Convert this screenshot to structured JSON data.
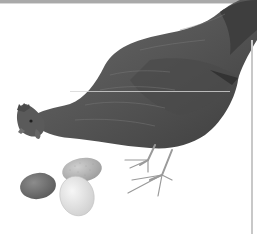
{
  "image": {
    "subject": "hen with eggs illustration",
    "palette": {
      "background": "#ffffff",
      "hen_body": "#5a5a5a",
      "hen_dark": "#3e3e3e",
      "hen_light": "#7a7a7a",
      "egg_dark": "#6e6e6e",
      "egg_speckled": "#b8b8b8",
      "egg_white": "#e6e6e6",
      "legs": "#9a9a9a",
      "border": "#a9a9a9"
    },
    "elements": [
      "hen",
      "egg-dark",
      "egg-speckled",
      "egg-white"
    ]
  }
}
